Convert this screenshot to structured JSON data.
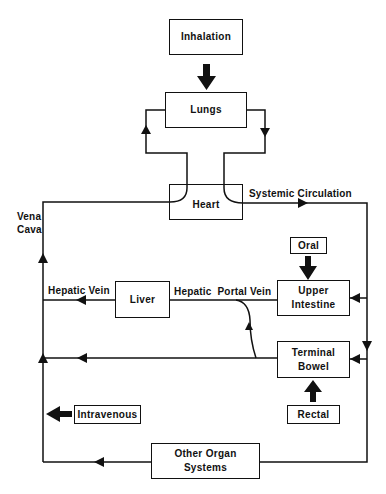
{
  "nodes": {
    "inhalation": "Inhalation",
    "lungs": "Lungs",
    "heart": "Heart",
    "liver": "Liver",
    "upper_intestine_1": "Upper",
    "upper_intestine_2": "Intestine",
    "terminal_bowel_1": "Terminal",
    "terminal_bowel_2": "Bowel",
    "oral": "Oral",
    "rectal": "Rectal",
    "intravenous": "Intravenous",
    "other_organs_1": "Other Organ",
    "other_organs_2": "Systems"
  },
  "edge_labels": {
    "systemic_circulation": "Systemic Circulation",
    "vena_cava_1": "Vena",
    "vena_cava_2": "Cava",
    "hepatic_vein": "Hepatic Vein",
    "hepatic_portal_vein": "Hepatic  Portal Vein"
  },
  "colors": {
    "line": "#111111",
    "background": "#ffffff"
  }
}
